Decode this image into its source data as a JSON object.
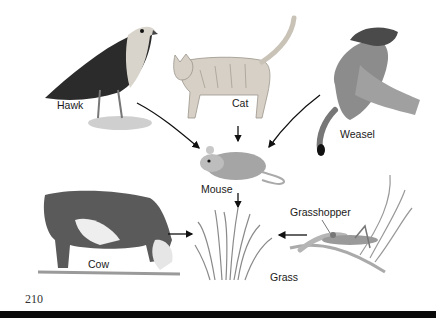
{
  "diagram": {
    "type": "food-web",
    "nodes": [
      {
        "id": "hawk",
        "label": "Hawk"
      },
      {
        "id": "cat",
        "label": "Cat"
      },
      {
        "id": "weasel",
        "label": "Weasel"
      },
      {
        "id": "mouse",
        "label": "Mouse"
      },
      {
        "id": "cow",
        "label": "Cow"
      },
      {
        "id": "grass",
        "label": "Grass"
      },
      {
        "id": "grasshopper",
        "label": "Grasshopper"
      }
    ],
    "edges": [
      {
        "from": "hawk",
        "to": "mouse"
      },
      {
        "from": "cat",
        "to": "mouse"
      },
      {
        "from": "weasel",
        "to": "mouse"
      },
      {
        "from": "mouse",
        "to": "grass"
      },
      {
        "from": "cow",
        "to": "grass"
      },
      {
        "from": "grasshopper",
        "to": "grass"
      }
    ]
  },
  "labels": {
    "hawk": "Hawk",
    "cat": "Cat",
    "weasel": "Weasel",
    "mouse": "Mouse",
    "cow": "Cow",
    "grass": "Grass",
    "grasshopper": "Grasshopper"
  },
  "page": {
    "number": "210"
  }
}
